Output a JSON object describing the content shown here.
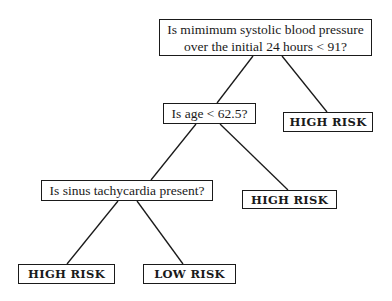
{
  "diagram": {
    "type": "decision-tree",
    "nodes": {
      "root": {
        "kind": "question",
        "line1": "Is mimimum systolic blood pressure",
        "line2": "over the initial 24 hours < 91?"
      },
      "age": {
        "kind": "question",
        "label": "Is age < 62.5?"
      },
      "high_risk_1": {
        "kind": "outcome",
        "label": "HIGH RISK"
      },
      "sinus": {
        "kind": "question",
        "label": "Is sinus tachycardia present?"
      },
      "high_risk_2": {
        "kind": "outcome",
        "label": "HIGH RISK"
      },
      "high_risk_3": {
        "kind": "outcome",
        "label": "HIGH RISK"
      },
      "low_risk": {
        "kind": "outcome",
        "label": "LOW RISK"
      }
    },
    "edges": [
      {
        "from": "root",
        "to": "age"
      },
      {
        "from": "root",
        "to": "high_risk_1"
      },
      {
        "from": "age",
        "to": "sinus"
      },
      {
        "from": "age",
        "to": "high_risk_2"
      },
      {
        "from": "sinus",
        "to": "high_risk_3"
      },
      {
        "from": "sinus",
        "to": "low_risk"
      }
    ]
  }
}
